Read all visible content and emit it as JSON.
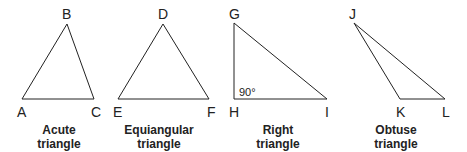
{
  "triangles": [
    {
      "name": "acute",
      "caption_line1": "Acute",
      "caption_line2": "triangle",
      "vertices": {
        "A": [
          22,
          99
        ],
        "B": [
          67,
          24
        ],
        "C": [
          94,
          99
        ]
      },
      "labels": {
        "A": "A",
        "B": "B",
        "C": "C"
      }
    },
    {
      "name": "equiangular",
      "caption_line1": "Equiangular",
      "caption_line2": "triangle",
      "vertices": {
        "D": [
          163,
          24
        ],
        "E": [
          118,
          99
        ],
        "F": [
          209,
          99
        ]
      },
      "labels": {
        "D": "D",
        "E": "E",
        "F": "F"
      }
    },
    {
      "name": "right",
      "caption_line1": "Right",
      "caption_line2": "triangle",
      "vertices": {
        "G": [
          234,
          23
        ],
        "H": [
          234,
          99
        ],
        "I": [
          327,
          99
        ]
      },
      "labels": {
        "G": "G",
        "H": "H",
        "I": "I"
      },
      "angle_label": "90°"
    },
    {
      "name": "obtuse",
      "caption_line1": "Obtuse",
      "caption_line2": "triangle",
      "vertices": {
        "J": [
          354,
          23
        ],
        "K": [
          400,
          99
        ],
        "L": [
          445,
          99
        ]
      },
      "labels": {
        "J": "J",
        "K": "K",
        "L": "L"
      }
    }
  ],
  "colors": {
    "stroke": "#222222",
    "background": "#ffffff"
  }
}
